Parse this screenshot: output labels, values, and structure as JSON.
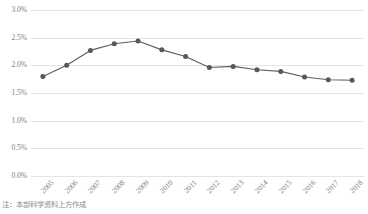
{
  "chart_data": {
    "type": "line",
    "title": "",
    "subtitle": "",
    "xlabel": "",
    "ylabel": "",
    "categories": [
      "2005",
      "2006",
      "2007",
      "2008",
      "2009",
      "2010",
      "2011",
      "2012",
      "2013",
      "2014",
      "2015",
      "2016",
      "2017",
      "2018"
    ],
    "values": [
      1.8,
      2.0,
      2.27,
      2.39,
      2.44,
      2.28,
      2.16,
      1.96,
      1.98,
      1.92,
      1.89,
      1.79,
      1.74,
      1.73
    ],
    "series": [
      {
        "name": "",
        "values": [
          1.8,
          2.0,
          2.27,
          2.39,
          2.44,
          2.28,
          2.16,
          1.96,
          1.98,
          1.92,
          1.89,
          1.79,
          1.74,
          1.73
        ]
      }
    ],
    "ylim": [
      0.0,
      3.0
    ],
    "ytick_values": [
      0.0,
      0.5,
      1.0,
      1.5,
      2.0,
      2.5,
      3.0
    ],
    "ytick_labels": [
      "0.0%",
      "0.5%",
      "1.0%",
      "1.5%",
      "2.0%",
      "2.5%",
      "3.0%"
    ],
    "value_unit": "%",
    "grid": true,
    "grid_axis": "y",
    "legend": false,
    "legend_position": "none",
    "markers": true,
    "marker_shape": "circle",
    "line_color": "#5e5e5e",
    "marker_color": "#585858",
    "grid_color": "#e4e4e4",
    "text_color": "#7d7d7d",
    "background_color": "#ffffff",
    "xtick_rotation": -45,
    "annotations": []
  },
  "caption": {
    "text": "注：本部科学资料上方作成"
  }
}
